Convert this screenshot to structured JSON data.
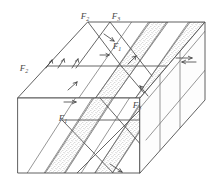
{
  "figure": {
    "background_color": "#ffffff",
    "line_color": "#4f4f4f",
    "label_color": "#4a4a4a",
    "stipple_color": "#8a8a8a"
  },
  "labels": [
    {
      "id": "label-f2-top",
      "base": "F",
      "sub": "2",
      "x": 85,
      "y": 17,
      "name": "fault-label-f2-top"
    },
    {
      "id": "label-f3-top",
      "base": "F",
      "sub": "3",
      "x": 116,
      "y": 17,
      "name": "fault-label-f3-top"
    },
    {
      "id": "label-f1-mid",
      "base": "F",
      "sub": "1",
      "x": 117,
      "y": 47,
      "name": "fault-label-f1-middle"
    },
    {
      "id": "label-f2-left",
      "base": "F",
      "sub": "2",
      "x": 24,
      "y": 69,
      "name": "fault-label-f2-left"
    },
    {
      "id": "label-f3-right",
      "base": "F",
      "sub": "3",
      "x": 137,
      "y": 106,
      "name": "fault-label-f3-right"
    },
    {
      "id": "label-f1-lower",
      "base": "F",
      "sub": "1",
      "x": 63,
      "y": 119,
      "name": "fault-label-f1-lower"
    }
  ],
  "fault_sets": [
    {
      "name": "F1",
      "role": "first-generation fault set"
    },
    {
      "name": "F2",
      "role": "second-generation fault set"
    },
    {
      "name": "F3",
      "role": "third-generation fault set"
    }
  ],
  "slip_arrows": [
    {
      "name": "slip-arrow-top-left-1",
      "sense": "dip-slip"
    },
    {
      "name": "slip-arrow-top-left-2",
      "sense": "dip-slip"
    },
    {
      "name": "slip-arrow-top-centre",
      "sense": "dip-slip"
    },
    {
      "name": "slip-arrow-top-right",
      "sense": "strike-slip"
    },
    {
      "name": "slip-arrow-far-right",
      "sense": "strike-slip-double"
    },
    {
      "name": "slip-arrow-front-left",
      "sense": "dip-slip"
    },
    {
      "name": "slip-arrow-front-right",
      "sense": "dip-slip"
    },
    {
      "name": "slip-arrow-base",
      "sense": "dip-slip"
    }
  ],
  "marker_beds": [
    {
      "name": "stipple-band-top-right",
      "pattern": "stippled"
    },
    {
      "name": "stipple-band-top-far-right",
      "pattern": "stippled"
    },
    {
      "name": "stipple-band-front",
      "pattern": "stippled"
    },
    {
      "name": "stipple-band-base",
      "pattern": "stippled"
    }
  ]
}
